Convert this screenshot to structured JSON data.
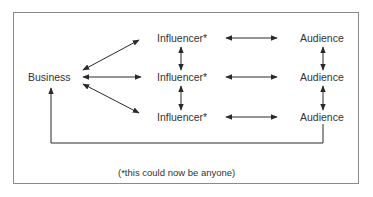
{
  "diagram": {
    "source": {
      "label": "Business"
    },
    "influencers": [
      {
        "label": "Influencer*"
      },
      {
        "label": "Influencer*"
      },
      {
        "label": "Influencer*"
      }
    ],
    "audiences": [
      {
        "label": "Audience"
      },
      {
        "label": "Audience"
      },
      {
        "label": "Audience"
      }
    ],
    "edges": [
      {
        "from": "Business",
        "to": "Influencer 1",
        "type": "bidirectional"
      },
      {
        "from": "Business",
        "to": "Influencer 2",
        "type": "bidirectional"
      },
      {
        "from": "Business",
        "to": "Influencer 3",
        "type": "bidirectional"
      },
      {
        "from": "Influencer 1",
        "to": "Influencer 2",
        "type": "bidirectional"
      },
      {
        "from": "Influencer 2",
        "to": "Influencer 3",
        "type": "bidirectional"
      },
      {
        "from": "Influencer 1",
        "to": "Audience 1",
        "type": "bidirectional"
      },
      {
        "from": "Influencer 2",
        "to": "Audience 2",
        "type": "bidirectional"
      },
      {
        "from": "Influencer 3",
        "to": "Audience 3",
        "type": "bidirectional"
      },
      {
        "from": "Audience 1",
        "to": "Audience 2",
        "type": "bidirectional"
      },
      {
        "from": "Audience 2",
        "to": "Audience 3",
        "type": "bidirectional"
      },
      {
        "from": "Audience 3",
        "to": "Business",
        "type": "directed-feedback-loop"
      }
    ],
    "footnote": "(*this could now be anyone)"
  },
  "colors": {
    "line": "#2a2a2a",
    "frame": "#8a8a8a",
    "text": "#333333"
  }
}
